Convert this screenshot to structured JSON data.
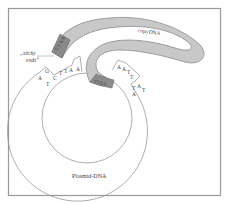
{
  "diagram": {
    "labels": {
      "sticky_ends_line1": "„sticky",
      "sticky_ends_line2": "ends“",
      "copy_dna": "copyDNA",
      "plasmid_dna": "Plasmid-DNA"
    },
    "left_sticky_end": {
      "top_strand": [
        "T",
        "T",
        "A",
        "A"
      ],
      "bottom_strand": [
        "A",
        "G",
        "C",
        "T",
        "T",
        "C"
      ],
      "letters": [
        "A",
        "G",
        "T",
        "C",
        "T",
        "T",
        "A",
        "A"
      ]
    },
    "right_sticky_end": {
      "letters": [
        "A",
        "A",
        "T",
        "T",
        "A",
        "T",
        "T",
        "A"
      ]
    },
    "copy_dna_end_top": [
      "T",
      "T",
      "A",
      "A"
    ],
    "copy_dna_end_bottom": [
      "T",
      "T",
      "A",
      "A"
    ],
    "colors": {
      "copy_dna_fill": "#c8c8c8",
      "copy_dna_end_fill": "#8a8a8a",
      "outline": "#888888",
      "frame": "#9a9a9a"
    }
  }
}
